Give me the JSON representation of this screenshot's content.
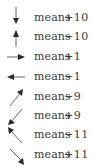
{
  "legend": {
    "rows": [
      {
        "direction": "down",
        "arrow_icon": "arrow-down-icon",
        "label": "means",
        "value": "+10"
      },
      {
        "direction": "up",
        "arrow_icon": "arrow-up-icon",
        "label": "means",
        "value": "−10"
      },
      {
        "direction": "right",
        "arrow_icon": "arrow-right-icon",
        "label": "means",
        "value": "+1"
      },
      {
        "direction": "left",
        "arrow_icon": "arrow-left-icon",
        "label": "means",
        "value": "−1"
      },
      {
        "direction": "up-right",
        "arrow_icon": "arrow-up-right-icon",
        "label": "means",
        "value": "−9"
      },
      {
        "direction": "down-left",
        "arrow_icon": "arrow-down-left-icon",
        "label": "means",
        "value": "+9"
      },
      {
        "direction": "up-left",
        "arrow_icon": "arrow-up-left-icon",
        "label": "means",
        "value": "−11"
      },
      {
        "direction": "down-right",
        "arrow_icon": "arrow-down-right-icon",
        "label": "means",
        "value": "+11"
      }
    ]
  },
  "colors": {
    "ink": "#3a3a3a",
    "arrow": "#2a2a2a",
    "background": "#ffffff"
  }
}
